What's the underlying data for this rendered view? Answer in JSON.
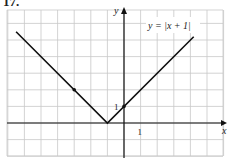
{
  "problem_number": "17.",
  "chart_data": {
    "type": "line",
    "title": "",
    "function_label": "y = |x + 1|",
    "xlabel": "x",
    "ylabel": "y",
    "x_tick_label": "1",
    "y_tick_label": "1",
    "xlim": [
      -7,
      6
    ],
    "ylim": [
      -2,
      7
    ],
    "grid": true,
    "series": [
      {
        "name": "y = |x + 1|",
        "x": [
          -6.5,
          -1,
          4.2
        ],
        "y": [
          5.5,
          0,
          5.2
        ]
      }
    ],
    "marked_points": [
      {
        "x": -3,
        "y": 2
      },
      {
        "x": 0,
        "y": 1
      }
    ],
    "vertex": {
      "x": -1,
      "y": 0
    }
  }
}
